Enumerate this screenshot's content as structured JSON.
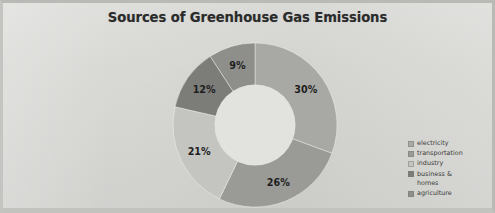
{
  "chart_data": {
    "type": "pie",
    "title": "Sources of Greenhouse Gas Emissions",
    "subtitle": "",
    "xlabel": "",
    "ylabel": "",
    "donut": true,
    "grid": false,
    "legend_position": "right",
    "categories": [
      "electricity",
      "transportation",
      "industry",
      "business & homes",
      "agriculture"
    ],
    "values": [
      30,
      26,
      21,
      12,
      9
    ],
    "data_labels": [
      "30%",
      "26%",
      "21%",
      "12%",
      "9%"
    ],
    "units": "percent",
    "slices": [
      {
        "label": "electricity",
        "value": 30,
        "data_label": "30%",
        "color": "#a8a9a5",
        "start_angle": 201.6,
        "end_angle": 309.6
      },
      {
        "label": "transportation",
        "value": 26,
        "data_label": "26%",
        "color": "#9a9b97",
        "start_angle": 108.0,
        "end_angle": 201.6
      },
      {
        "label": "industry",
        "value": 21,
        "data_label": "21%",
        "color": "#c4c5c1",
        "start_angle": 32.4,
        "end_angle": 108.0
      },
      {
        "label": "business & homes",
        "value": 12,
        "data_label": "12%",
        "color": "#7c7d79",
        "start_angle": -0.0,
        "end_angle": 32.4
      },
      {
        "label": "agriculture",
        "value": 9,
        "data_label": "9%",
        "color": "#8e8f8b",
        "start_angle": -32.4,
        "end_angle": 0.0
      }
    ]
  },
  "legend": {
    "items": [
      {
        "label": "electricity",
        "color": "#a8a9a5"
      },
      {
        "label": "transportation",
        "color": "#9a9b97"
      },
      {
        "label": "industry",
        "color": "#c4c5c1"
      },
      {
        "label": "business &\nhomes",
        "color": "#7c7d79"
      },
      {
        "label": "agriculture",
        "color": "#8e8f8b"
      }
    ]
  },
  "colors": {
    "background": "#d7d8d4",
    "title_text": "#2b2b2b",
    "label_text": "#1e1e1e",
    "legend_text": "#3a3a3a",
    "donut_hole": "#e2e3df"
  }
}
